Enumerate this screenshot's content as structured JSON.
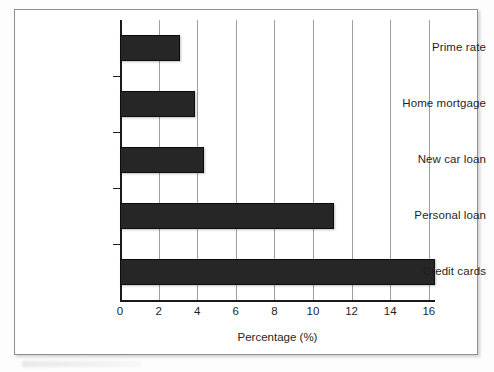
{
  "chart_data": {
    "type": "bar",
    "orientation": "horizontal",
    "title": "",
    "xlabel": "Percentage (%)",
    "ylabel": "",
    "categories": [
      "Prime rate",
      "Home mortgage",
      "New car loan",
      "Personal loan",
      "Credit cards"
    ],
    "values": [
      3.1,
      3.9,
      4.35,
      11.1,
      16.3
    ],
    "xlim": [
      0,
      16.3
    ],
    "xticks": [
      0,
      2,
      4,
      6,
      8,
      10,
      12,
      14,
      16
    ],
    "xtick_labels": [
      "0",
      "2",
      "4",
      "6",
      "8",
      "10",
      "12",
      "14",
      "16"
    ],
    "grid": "vertical",
    "legend": "none",
    "bar_color": "#262626"
  },
  "figure": {
    "axis_title": "Percentage (%)",
    "border_color": "#8d9196",
    "background": "#ffffff"
  }
}
